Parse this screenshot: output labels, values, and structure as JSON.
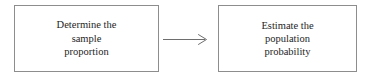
{
  "diagram": {
    "type": "flowchart",
    "background_color": "#ffffff",
    "border_color": "#8d8d8d",
    "text_color": "#252525",
    "nodes": [
      {
        "id": "determine-sample-proportion",
        "shape": "rectangle",
        "lines": [
          "Determine the",
          "sample",
          "proportion"
        ]
      },
      {
        "id": "estimate-population-probability",
        "shape": "rectangle",
        "lines": [
          "Estimate the",
          "population",
          "probability"
        ]
      }
    ],
    "connector": {
      "icon": "arrow-right-icon",
      "style": "open-arrowhead",
      "direction": "right",
      "from": "determine-sample-proportion",
      "to": "estimate-population-probability",
      "color": "#6e6e6e"
    }
  }
}
